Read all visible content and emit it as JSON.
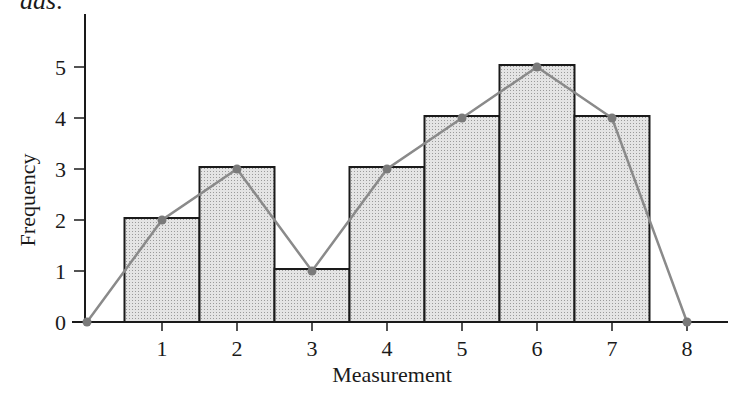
{
  "header": {
    "clipped_text": "das:"
  },
  "chart_data": {
    "type": "bar",
    "subtype": "histogram_with_frequency_polygon",
    "title": "",
    "xlabel": "Measurement",
    "ylabel": "Frequency",
    "categories": [
      1,
      2,
      3,
      4,
      5,
      6,
      7
    ],
    "values": [
      2,
      3,
      1,
      3,
      4,
      5,
      4
    ],
    "x_ticks": [
      1,
      2,
      3,
      4,
      5,
      6,
      7,
      8
    ],
    "y_ticks": [
      0,
      1,
      2,
      3,
      4,
      5
    ],
    "xlim": [
      0,
      8.5
    ],
    "ylim": [
      0,
      6
    ],
    "grid": false,
    "legend": null,
    "series": [
      {
        "name": "histogram",
        "type": "bar",
        "x": [
          1,
          2,
          3,
          4,
          5,
          6,
          7
        ],
        "values": [
          2,
          3,
          1,
          3,
          4,
          5,
          4
        ]
      },
      {
        "name": "frequency polygon",
        "type": "line",
        "x": [
          0,
          1,
          2,
          3,
          4,
          5,
          6,
          7,
          8
        ],
        "values": [
          0,
          2,
          3,
          1,
          3,
          4,
          5,
          4,
          0
        ]
      }
    ],
    "colors": {
      "bar_fill": "#d6d6d6",
      "bar_stroke": "#1a1a1a",
      "line": "#8a8a8a",
      "marker": "#7a7a7a",
      "axis": "#1a1a1a"
    }
  }
}
